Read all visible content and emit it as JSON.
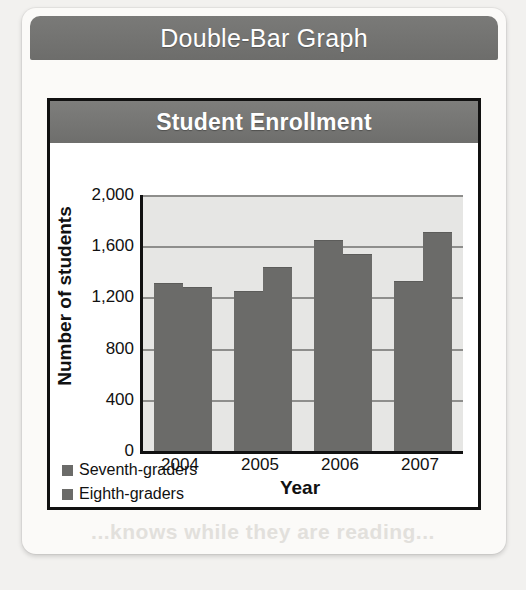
{
  "page": {
    "card_title": "Double-Bar Graph",
    "ghost_text_lower": "...knows while they are reading...",
    "ghost_text_upper": ""
  },
  "chart_data": {
    "type": "bar",
    "title": "Student Enrollment",
    "xlabel": "Year",
    "ylabel": "Number of students",
    "categories": [
      "2004",
      "2005",
      "2006",
      "2007"
    ],
    "series": [
      {
        "name": "Seventh-graders",
        "values": [
          1310,
          1250,
          1650,
          1330
        ],
        "color": "#6b6b69"
      },
      {
        "name": "Eighth-graders",
        "values": [
          1280,
          1440,
          1540,
          1710
        ],
        "color": "#6b6b69"
      }
    ],
    "ylim": [
      0,
      2000
    ],
    "yticks": [
      0,
      400,
      800,
      1200,
      1600,
      2000
    ],
    "ytick_labels": [
      "0",
      "400",
      "800",
      "1,200",
      "1,600",
      "2,000"
    ],
    "grid": true,
    "legend_position": "bottom-left",
    "plot_background": "#e6e6e4",
    "axis_color": "#111111",
    "gridline_color": "#8e8e8c"
  }
}
